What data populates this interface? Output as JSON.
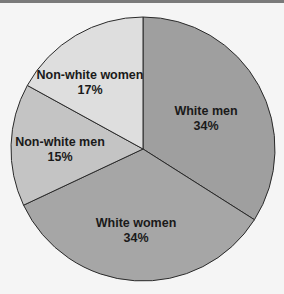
{
  "chart_data": {
    "type": "pie",
    "title": "",
    "categories": [
      "White men",
      "White women",
      "Non-white men",
      "Non-white women"
    ],
    "values": [
      34,
      34,
      15,
      17
    ],
    "labels": [
      {
        "name": "White men",
        "pct": "34%"
      },
      {
        "name": "White women",
        "pct": "34%"
      },
      {
        "name": "Non-white men",
        "pct": "15%"
      },
      {
        "name": "Non-white women",
        "pct": "17%"
      }
    ],
    "colors": [
      "#9f9f9f",
      "#a6a6a6",
      "#c4c4c4",
      "#dedede"
    ],
    "start_angle": "12 o'clock, clockwise",
    "legend": "none (labels on slices)"
  }
}
